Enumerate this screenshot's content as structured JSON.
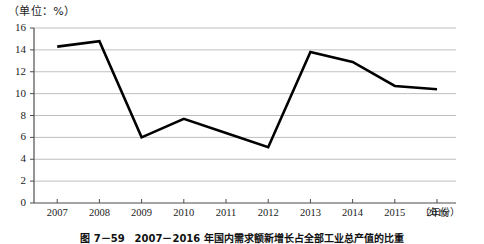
{
  "figure": {
    "unit_label": "（单位：%）",
    "x_axis_unit": "（年份）",
    "caption": "图 7－59　2007－2016 年国内需求额新增长占全部工业总产值的比重"
  },
  "chart_data": {
    "type": "line",
    "title": "",
    "xlabel": "年份",
    "ylabel": "",
    "unit": "%",
    "categories": [
      "2007",
      "2008",
      "2009",
      "2010",
      "2011",
      "2012",
      "2013",
      "2014",
      "2015",
      "2016"
    ],
    "values": [
      14.3,
      14.8,
      6.0,
      7.7,
      6.4,
      5.1,
      13.8,
      12.9,
      10.7,
      10.4
    ],
    "ylim": [
      0,
      16
    ],
    "ytick_step": 2,
    "yticks": [
      "0",
      "2",
      "4",
      "6",
      "8",
      "10",
      "12",
      "14",
      "16"
    ],
    "grid": "horizontal",
    "legend": "none",
    "line_color": "#000000",
    "grid_color": "#bfbfbf",
    "axis_color": "#4d4d4d"
  }
}
